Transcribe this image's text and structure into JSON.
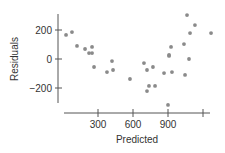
{
  "chart_data": {
    "type": "scatter",
    "title": "",
    "xlabel": "Predicted",
    "ylabel": "Residuals",
    "xlim": [
      -20,
      1260
    ],
    "ylim": [
      -320,
      310
    ],
    "x_ticks": [
      300,
      600,
      900,
      1200
    ],
    "x_tick_labels": [
      "300",
      "600",
      "900",
      ""
    ],
    "y_ticks": [
      200,
      0,
      -200
    ],
    "y_tick_labels": [
      "200",
      "0",
      "−200"
    ],
    "grid": false,
    "legend": null,
    "points": [
      {
        "x": 26,
        "y": 166
      },
      {
        "x": 77,
        "y": 186
      },
      {
        "x": 120,
        "y": 90
      },
      {
        "x": 189,
        "y": 69
      },
      {
        "x": 249,
        "y": 83
      },
      {
        "x": 223,
        "y": 41
      },
      {
        "x": 249,
        "y": 41
      },
      {
        "x": 266,
        "y": -55
      },
      {
        "x": 377,
        "y": -90
      },
      {
        "x": 420,
        "y": -14
      },
      {
        "x": 429,
        "y": -76
      },
      {
        "x": 574,
        "y": -138
      },
      {
        "x": 694,
        "y": -28
      },
      {
        "x": 720,
        "y": -76
      },
      {
        "x": 771,
        "y": -55
      },
      {
        "x": 737,
        "y": -186
      },
      {
        "x": 789,
        "y": -186
      },
      {
        "x": 720,
        "y": -221
      },
      {
        "x": 866,
        "y": -97
      },
      {
        "x": 900,
        "y": -317
      },
      {
        "x": 909,
        "y": 28
      },
      {
        "x": 909,
        "y": 21
      },
      {
        "x": 926,
        "y": 83
      },
      {
        "x": 934,
        "y": -90
      },
      {
        "x": 1037,
        "y": 103
      },
      {
        "x": 1046,
        "y": -110
      },
      {
        "x": 1063,
        "y": 303
      },
      {
        "x": 1080,
        "y": 0
      },
      {
        "x": 1089,
        "y": 179
      },
      {
        "x": 1131,
        "y": 234
      },
      {
        "x": 1269,
        "y": 179
      }
    ],
    "colors": {
      "point": "#8a8a8a",
      "axis": "#555555",
      "text": "#333333"
    }
  }
}
